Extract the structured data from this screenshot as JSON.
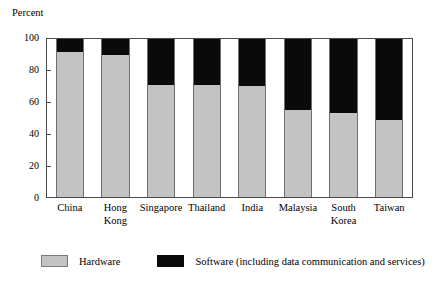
{
  "chart_data": {
    "type": "bar",
    "subtype": "stacked-100",
    "title": "",
    "xlabel": "",
    "ylabel": "Percent",
    "ylim": [
      0,
      100
    ],
    "yticks": [
      0,
      20,
      40,
      60,
      80,
      100
    ],
    "grid": false,
    "legend_position": "bottom",
    "categories": [
      "China",
      "Hong\nKong",
      "Singapore",
      "Thailand",
      "India",
      "Malaysia",
      "South\nKorea",
      "Taiwan"
    ],
    "series": [
      {
        "name": "Hardware",
        "color": "#c3c3c3",
        "values": [
          92,
          90,
          71,
          71,
          70,
          55,
          53,
          49
        ]
      },
      {
        "name": "Software (including data communication and services)",
        "color": "#0a0a0a",
        "values": [
          8,
          10,
          29,
          29,
          30,
          45,
          47,
          51
        ]
      }
    ]
  },
  "legend": {
    "hardware_label": "Hardware",
    "software_label": "Software (including data communication and services)"
  }
}
